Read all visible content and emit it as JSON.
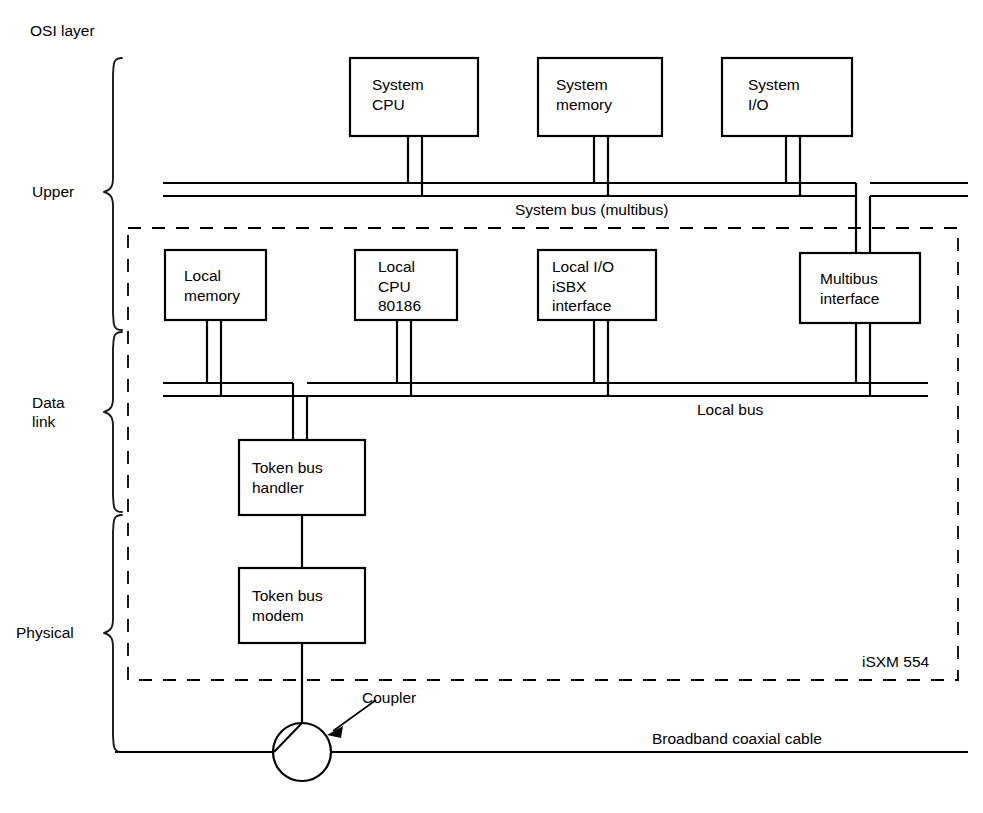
{
  "diagram": {
    "title": "OSI layer",
    "enclosure_label": "iSXM 554",
    "osi_layers": [
      {
        "id": "upper",
        "label": "Upper"
      },
      {
        "id": "data-link",
        "label": "Data\nlink"
      },
      {
        "id": "physical",
        "label": "Physical"
      }
    ],
    "boxes": [
      {
        "id": "system-cpu",
        "label": "System\nCPU",
        "x": 350,
        "y": 58,
        "w": 128,
        "h": 78
      },
      {
        "id": "system-memory",
        "label": "System\nmemory",
        "x": 538,
        "y": 58,
        "w": 124,
        "h": 78
      },
      {
        "id": "system-io",
        "label": "System\nI/O",
        "x": 722,
        "y": 58,
        "w": 130,
        "h": 78
      },
      {
        "id": "local-memory",
        "label": "Local\nmemory",
        "x": 165,
        "y": 250,
        "w": 101,
        "h": 70
      },
      {
        "id": "local-cpu-80186",
        "label": "Local\nCPU\n80186",
        "x": 355,
        "y": 250,
        "w": 102,
        "h": 70
      },
      {
        "id": "local-io-isbx-interface",
        "label": "Local I/O\niSBX\ninterface",
        "x": 538,
        "y": 250,
        "w": 118,
        "h": 70
      },
      {
        "id": "multibus-interface",
        "label": "Multibus\ninterface",
        "x": 800,
        "y": 253,
        "w": 120,
        "h": 70
      },
      {
        "id": "token-bus-handler",
        "label": "Token bus\nhandler",
        "x": 239,
        "y": 440,
        "w": 126,
        "h": 75
      },
      {
        "id": "token-bus-modem",
        "label": "Token bus\nmodem",
        "x": 239,
        "y": 568,
        "w": 126,
        "h": 75
      }
    ],
    "buses": [
      {
        "id": "system-bus",
        "label": "System bus (multibus)",
        "label_x": 515,
        "label_y": 200
      },
      {
        "id": "local-bus",
        "label": "Local bus",
        "label_x": 697,
        "label_y": 400
      },
      {
        "id": "broadband-coaxial-cable",
        "label": "Broadband coaxial cable",
        "label_x": 652,
        "label_y": 729
      }
    ],
    "annotations": [
      {
        "id": "coupler",
        "label": "Coupler",
        "label_x": 362,
        "label_y": 697
      }
    ],
    "colors": {
      "ink": "#000000",
      "background": "#ffffff"
    }
  }
}
